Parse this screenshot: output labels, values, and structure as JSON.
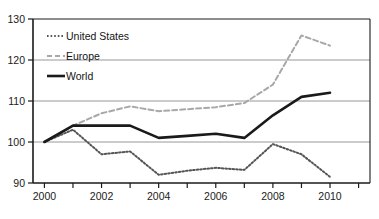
{
  "chart_data": {
    "type": "line",
    "title": "",
    "xlabel": "",
    "ylabel": "",
    "x": [
      2000,
      2001,
      2002,
      2003,
      2004,
      2005,
      2006,
      2007,
      2008,
      2009,
      2010
    ],
    "xlim": [
      1999.6,
      2011.4
    ],
    "ylim": [
      90,
      130
    ],
    "yticks": [
      90,
      100,
      110,
      120,
      130
    ],
    "ytick_labels": [
      "90",
      "100",
      "110",
      "120",
      "130"
    ],
    "xticks": [
      2000,
      2001,
      2002,
      2003,
      2004,
      2005,
      2006,
      2007,
      2008,
      2009,
      2010,
      2011
    ],
    "xtick_labels": [
      "2000",
      "",
      "2002",
      "",
      "2004",
      "",
      "2006",
      "",
      "2008",
      "",
      "2010",
      ""
    ],
    "grid": "horizontal",
    "legend_position": "upper-left-inside",
    "series": [
      {
        "name": "United States",
        "style": "fine-dotted",
        "color": "#555555",
        "values": [
          100,
          103,
          97,
          97.7,
          92,
          93,
          93.7,
          93.2,
          99.5,
          97,
          91.5
        ]
      },
      {
        "name": "Europe",
        "style": "dashed",
        "color": "#a8a8a8",
        "values": [
          100,
          104,
          107,
          108.7,
          107.5,
          108,
          108.5,
          109.5,
          114,
          126,
          123.5
        ]
      },
      {
        "name": "World",
        "style": "solid-bold",
        "color": "#1a1a1a",
        "values": [
          100,
          104,
          104,
          104,
          101,
          101.5,
          102,
          101,
          106.5,
          111,
          112
        ]
      }
    ]
  },
  "axis": {
    "y_labels": [
      "130",
      "120",
      "110",
      "100",
      "90"
    ],
    "x_labels": [
      "2000",
      "2002",
      "2004",
      "2006",
      "2008",
      "2010"
    ]
  },
  "legend": {
    "items": [
      {
        "label": "United States",
        "swatch": "dotted-swatch"
      },
      {
        "label": "Europe",
        "swatch": "dashed-swatch"
      },
      {
        "label": "World",
        "swatch": "solid-swatch"
      }
    ]
  }
}
